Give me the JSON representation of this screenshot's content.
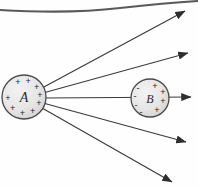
{
  "figure": {
    "canvas": {
      "width": 198,
      "height": 189
    },
    "background_color": "#fefefe",
    "ink_color": "#3a3a3a",
    "sphere_fill": "#e8e8e8",
    "sphere_stroke": "#4a4a4a"
  },
  "top_border": {
    "name": "top-curved-line",
    "stroke": "#5a5a5a",
    "stroke_width": 2.1,
    "path": "M 0 10 Q 70 14 120 8 Q 165 3 198 1"
  },
  "spheres": [
    {
      "id": "sphere-a",
      "label": "A",
      "cx": 24,
      "cy": 97,
      "r": 22,
      "charge_sign": "+",
      "charge_count": 9,
      "charge_layout": "ring",
      "charge_description": "positive charges distributed around perimeter"
    },
    {
      "id": "sphere-b",
      "label": "B",
      "cx": 150,
      "cy": 98,
      "r": 19,
      "charge_sign_near": "-",
      "charge_sign_far": "+",
      "charge_count_near": 4,
      "charge_count_far": 4,
      "charge_layout": "polarized",
      "charge_description": "induced negative charges on left face, positive charges on right face"
    }
  ],
  "field_lines": [
    {
      "id": "field-line-1",
      "label": "upper-outer-field-line",
      "x1": 42,
      "y1": 88,
      "x2": 185,
      "y2": 11
    },
    {
      "id": "field-line-2",
      "label": "upper-inner-field-line",
      "x1": 43,
      "y1": 93,
      "x2": 188,
      "y2": 53
    },
    {
      "id": "field-line-3",
      "label": "axis-field-line",
      "x1": 44,
      "y1": 98,
      "x2": 191,
      "y2": 97
    },
    {
      "id": "field-line-4",
      "label": "lower-inner-field-line",
      "x1": 43,
      "y1": 103,
      "x2": 186,
      "y2": 142
    },
    {
      "id": "field-line-5",
      "label": "lower-outer-field-line",
      "x1": 42,
      "y1": 108,
      "x2": 172,
      "y2": 182
    }
  ],
  "charge_glyph_positions": {
    "sphere_a_ring_angles_deg": [
      -112,
      -75,
      -38,
      -8,
      22,
      58,
      96,
      135,
      175
    ],
    "sphere_b_left_offsets": [
      {
        "dx": -12,
        "dy": -10
      },
      {
        "dx": -15,
        "dy": -2
      },
      {
        "dx": -14,
        "dy": 7
      },
      {
        "dx": -9,
        "dy": 14
      }
    ],
    "sphere_b_right_offsets": [
      {
        "dx": 5,
        "dy": -12
      },
      {
        "dx": 13,
        "dy": -6
      },
      {
        "dx": 13,
        "dy": 3
      },
      {
        "dx": 7,
        "dy": 12
      }
    ]
  }
}
